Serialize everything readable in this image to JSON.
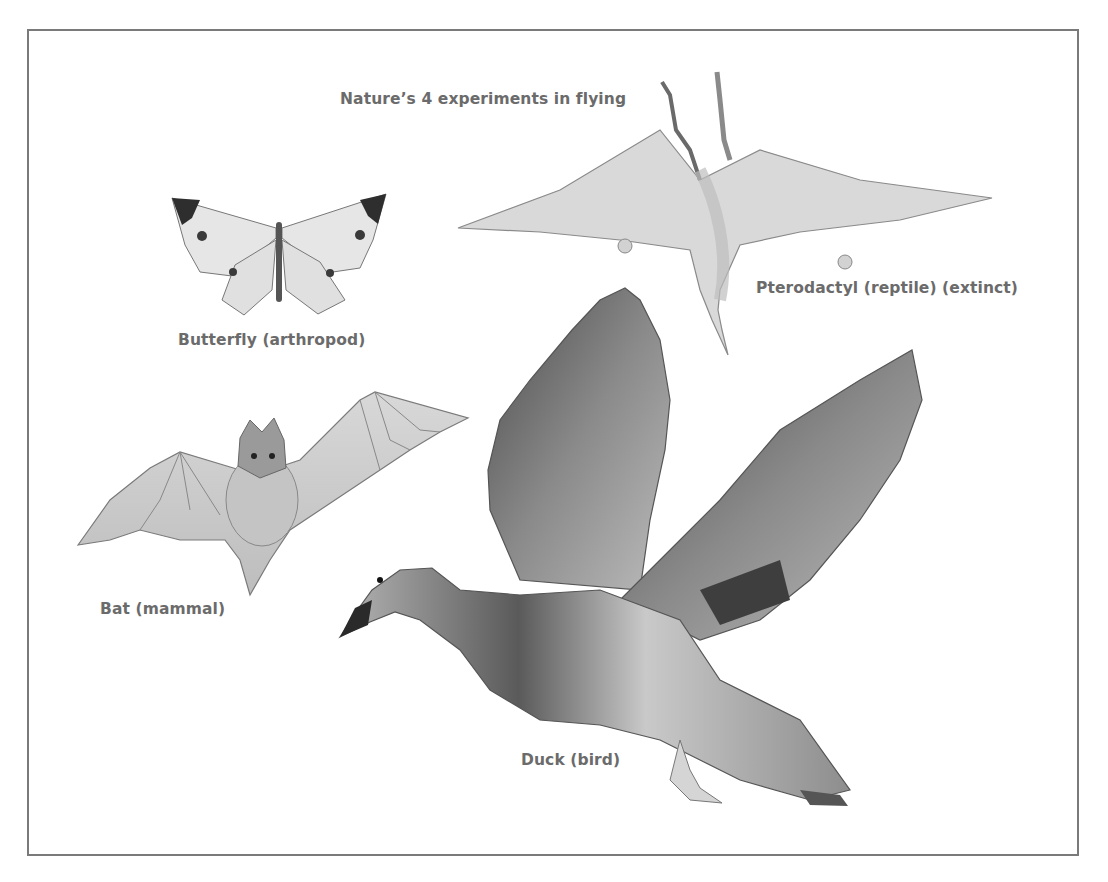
{
  "page": {
    "clipped_header_text": "... flying, only the pterosaurs, insects, bats and birds have evolved powered flight"
  },
  "figure": {
    "title": "Nature’s 4 experiments in flying",
    "animals": [
      {
        "id": "butterfly",
        "label": "Butterfly (arthropod)",
        "icon": "butterfly-illustration"
      },
      {
        "id": "pterodactyl",
        "label": "Pterodactyl (reptile) (extinct)",
        "icon": "pterodactyl-illustration"
      },
      {
        "id": "bat",
        "label": "Bat (mammal)",
        "icon": "bat-illustration"
      },
      {
        "id": "duck",
        "label": "Duck (bird)",
        "icon": "duck-illustration"
      }
    ]
  }
}
